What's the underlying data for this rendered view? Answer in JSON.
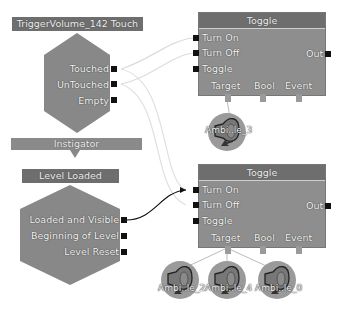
{
  "event_touch": {
    "title": "TriggerVolume_142 Touch",
    "outputs": [
      "Touched",
      "UnTouched",
      "Empty"
    ],
    "variable": "Instigator"
  },
  "event_level": {
    "title": "Level Loaded",
    "outputs": [
      "Loaded and Visible",
      "Beginning of Level",
      "Level Reset"
    ]
  },
  "toggles": [
    {
      "title": "Toggle",
      "inputs": [
        "Turn On",
        "Turn Off",
        "Toggle"
      ],
      "output": "Out",
      "variables": [
        "Target",
        "Bool",
        "Event"
      ],
      "targets": [
        "Ambi..le_3"
      ]
    },
    {
      "title": "Toggle",
      "inputs": [
        "Turn On",
        "Turn Off",
        "Toggle"
      ],
      "output": "Out",
      "variables": [
        "Target",
        "Bool",
        "Event"
      ],
      "targets": [
        "Ambi..le_2",
        "Ambi..le_4",
        "Ambi..le_0"
      ]
    }
  ],
  "colors": {
    "node_body": "#8e8e8e",
    "node_title": "#6e6e6e",
    "port": "#111111",
    "wire_active": "#111111",
    "wire_inactive": "#dddddd",
    "sound_circle": "#9a9a9a"
  }
}
